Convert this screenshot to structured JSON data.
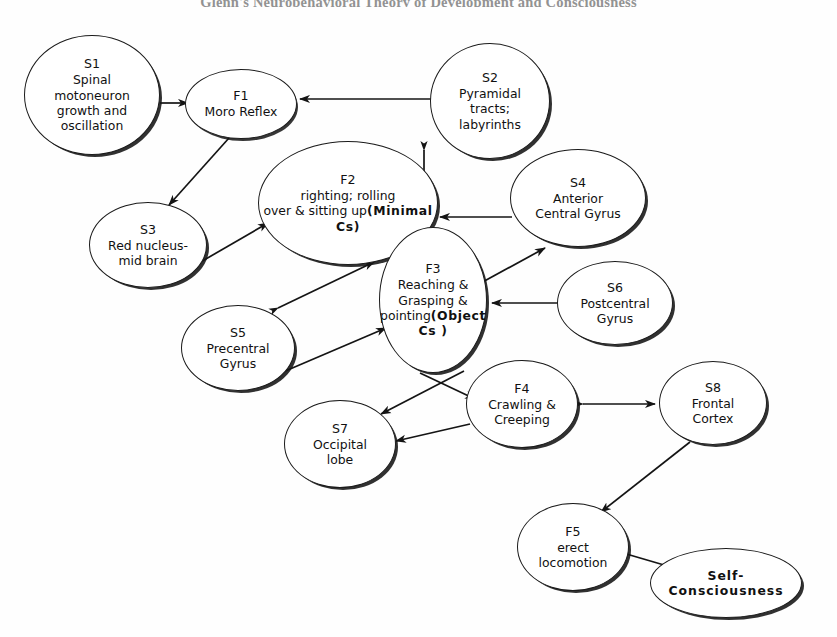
{
  "title": "Glenn's Neurobehavioral Theory of Development and Consciousness",
  "diagram": {
    "type": "directed-graph",
    "nodes": [
      {
        "id": "S1",
        "label": "S1",
        "text": "Spinal\nmotoneuron\ngrowth and\noscillation",
        "bold": false,
        "cx": 92,
        "cy": 95,
        "rx": 68,
        "ry": 60
      },
      {
        "id": "F1",
        "label": "F1",
        "text": "Moro Reflex",
        "bold": false,
        "cx": 241,
        "cy": 104,
        "rx": 56,
        "ry": 35
      },
      {
        "id": "S2",
        "label": "S2",
        "text": "Pyramidal\ntracts;\nlabyrinths",
        "bold": false,
        "cx": 490,
        "cy": 101,
        "rx": 60,
        "ry": 58
      },
      {
        "id": "F2",
        "label": "F2",
        "text": "righting; rolling\nover & sitting up",
        "bold_text": "(Minimal   Cs)",
        "bold": false,
        "cx": 348,
        "cy": 203,
        "rx": 90,
        "ry": 62
      },
      {
        "id": "S3",
        "label": "S3",
        "text": "Red nucleus-\nmid brain",
        "bold": false,
        "cx": 148,
        "cy": 245,
        "rx": 59,
        "ry": 43
      },
      {
        "id": "S4",
        "label": "S4",
        "text": "Anterior\nCentral Gyrus",
        "bold": false,
        "cx": 578,
        "cy": 198,
        "rx": 68,
        "ry": 49
      },
      {
        "id": "F3",
        "label": "F3",
        "text": "Reaching &\nGrasping &\npointing",
        "bold_text": "(Object\nCs )",
        "bold": false,
        "cx": 433,
        "cy": 300,
        "rx": 54,
        "ry": 73
      },
      {
        "id": "S6",
        "label": "S6",
        "text": "Postcentral\nGyrus",
        "bold": false,
        "cx": 615,
        "cy": 303,
        "rx": 58,
        "ry": 42
      },
      {
        "id": "S5",
        "label": "S5",
        "text": "Precentral\nGyrus",
        "bold": false,
        "cx": 238,
        "cy": 348,
        "rx": 57,
        "ry": 43
      },
      {
        "id": "F4",
        "label": "F4",
        "text": "Crawling &\nCreeping",
        "bold": false,
        "cx": 522,
        "cy": 404,
        "rx": 56,
        "ry": 44
      },
      {
        "id": "S7",
        "label": "S7",
        "text": "Occipital\nlobe",
        "bold": false,
        "cx": 340,
        "cy": 444,
        "rx": 56,
        "ry": 44
      },
      {
        "id": "S8",
        "label": "S8",
        "text": "Frontal\nCortex",
        "bold": false,
        "cx": 713,
        "cy": 403,
        "rx": 54,
        "ry": 42
      },
      {
        "id": "F5",
        "label": "F5",
        "text": "erect\nlocomotion",
        "bold": false,
        "cx": 573,
        "cy": 547,
        "rx": 56,
        "ry": 44
      },
      {
        "id": "SC",
        "label": "",
        "text": "Self-\nConsciousness",
        "bold": true,
        "cx": 726,
        "cy": 583,
        "rx": 76,
        "ry": 35
      }
    ],
    "edges": [
      {
        "from": "S1",
        "to": "F1",
        "arrows": "single"
      },
      {
        "from": "S2",
        "to": "F1",
        "arrows": "single"
      },
      {
        "from": "F1",
        "to": "S3",
        "arrows": "single"
      },
      {
        "from": "S3",
        "to": "F2",
        "arrows": "single"
      },
      {
        "from": "S2",
        "to": "F3",
        "arrows": "double"
      },
      {
        "from": "S4",
        "to": "F3",
        "arrows": "single"
      },
      {
        "from": "F2",
        "to": "S5",
        "arrows": "double"
      },
      {
        "from": "S5",
        "to": "F3",
        "arrows": "single"
      },
      {
        "from": "F3",
        "to": "S4",
        "arrows": "single"
      },
      {
        "from": "S6",
        "to": "F3",
        "arrows": "single"
      },
      {
        "from": "F3",
        "to": "F4",
        "arrows": "single"
      },
      {
        "from": "F3",
        "to": "S7",
        "arrows": "single"
      },
      {
        "from": "F4",
        "to": "S7",
        "arrows": "single"
      },
      {
        "from": "F4",
        "to": "S8",
        "arrows": "double"
      },
      {
        "from": "S8",
        "to": "F5",
        "arrows": "single"
      },
      {
        "from": "F5",
        "to": "SC",
        "arrows": "single"
      }
    ]
  }
}
